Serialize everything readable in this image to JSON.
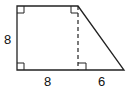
{
  "diagram": {
    "type": "right-trapezoid",
    "labels": {
      "left_side": "8",
      "bottom_left_segment": "8",
      "bottom_right_segment": "6"
    },
    "right_angle_markers": 4,
    "dashed_altitude": true,
    "stroke_color": "#222222",
    "background": "#ffffff"
  }
}
